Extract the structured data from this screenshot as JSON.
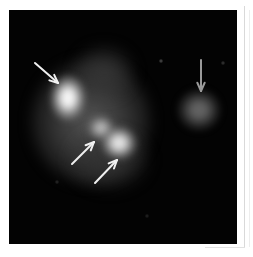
{
  "figure": {
    "kind": "astronomical-image",
    "background_color": "#ffffff",
    "plate_color": "#030303",
    "plate": {
      "x": 9,
      "y": 10,
      "width": 228,
      "height": 234
    },
    "annotation_color": "#f2f2f2",
    "caption": ""
  },
  "chart_data": {
    "type": "scatter",
    "title": "",
    "subtitle": "",
    "xlabel": "",
    "ylabel": "",
    "grid": false,
    "legend": "none",
    "xlim": [
      0,
      228
    ],
    "ylim": [
      0,
      234
    ],
    "sources": [
      {
        "label": "knot-a",
        "x": 59,
        "y": 88,
        "radius_x": 17,
        "radius_y": 22,
        "peak_brightness": 100,
        "note": "brightest elongated nucleus, upper-left"
      },
      {
        "label": "knot-b",
        "x": 92,
        "y": 118,
        "radius_x": 13,
        "radius_y": 12,
        "peak_brightness": 74,
        "note": "small intermediate knot"
      },
      {
        "label": "knot-c",
        "x": 110,
        "y": 133,
        "radius_x": 17,
        "radius_y": 16,
        "peak_brightness": 92,
        "note": "lower-right bright knot"
      },
      {
        "label": "companion",
        "x": 190,
        "y": 100,
        "radius_x": 21,
        "radius_y": 20,
        "peak_brightness": 40,
        "note": "faint isolated companion at right"
      }
    ],
    "envelopes": [
      {
        "label": "main-halo",
        "x": 82,
        "y": 112,
        "radius_x": 60,
        "radius_y": 62,
        "peak_brightness": 36
      },
      {
        "label": "upper-plume",
        "x": 95,
        "y": 62,
        "radius_x": 30,
        "radius_y": 26,
        "peak_brightness": 22
      },
      {
        "label": "lower-extension",
        "x": 100,
        "y": 150,
        "radius_x": 40,
        "radius_y": 30,
        "peak_brightness": 20
      }
    ],
    "specks": [
      {
        "label": "faint-star-1",
        "x": 152,
        "y": 51,
        "size": 2,
        "brightness": 30
      },
      {
        "label": "faint-star-2",
        "x": 214,
        "y": 53,
        "size": 2,
        "brightness": 22
      },
      {
        "label": "faint-star-3",
        "x": 48,
        "y": 172,
        "size": 2,
        "brightness": 16
      },
      {
        "label": "faint-star-4",
        "x": 138,
        "y": 206,
        "size": 2,
        "brightness": 14
      }
    ],
    "annotations": [
      {
        "label": "arrow-knot-a",
        "type": "arrow",
        "direction": "down-right",
        "tail": [
          26,
          53
        ],
        "head": [
          49,
          73
        ],
        "points_at": "knot-a",
        "color": "#f0f0f0"
      },
      {
        "label": "arrow-knot-b",
        "type": "arrow",
        "direction": "up-right",
        "tail": [
          63,
          154
        ],
        "head": [
          85,
          132
        ],
        "points_at": "knot-b",
        "color": "#f0f0f0"
      },
      {
        "label": "arrow-knot-c",
        "type": "arrow",
        "direction": "up-right",
        "tail": [
          86,
          173
        ],
        "head": [
          108,
          150
        ],
        "points_at": "knot-c",
        "color": "#f0f0f0"
      },
      {
        "label": "arrow-companion",
        "type": "arrow",
        "direction": "down",
        "tail": [
          192,
          50
        ],
        "head": [
          192,
          81
        ],
        "points_at": "companion",
        "color": "#9a9a9a"
      }
    ]
  }
}
